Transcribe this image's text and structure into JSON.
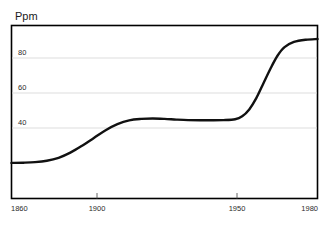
{
  "chart_data": {
    "type": "line",
    "title": "",
    "subtitle": "",
    "xlabel": "",
    "ylabel": "Ppm",
    "ylabel_position": "above-top-left",
    "grid": "horizontal-only",
    "legend": "none",
    "xlim": [
      1860,
      1990
    ],
    "ylim": [
      0,
      100
    ],
    "xticks": [
      1860,
      1900,
      1950,
      1980
    ],
    "xtick_labels": [
      "1860",
      "1900",
      "1950",
      "1980"
    ],
    "yticks": [
      40,
      60,
      80
    ],
    "ytick_labels": [
      "40",
      "60",
      "80"
    ],
    "series": [
      {
        "name": "Ppm",
        "color": "#111111",
        "x": [
          1860,
          1865,
          1870,
          1875,
          1880,
          1885,
          1890,
          1895,
          1900,
          1905,
          1910,
          1915,
          1920,
          1925,
          1930,
          1935,
          1940,
          1945,
          1950,
          1955,
          1958,
          1961,
          1964,
          1967,
          1970,
          1973,
          1976,
          1980,
          1985,
          1990
        ],
        "y": [
          20.6,
          20.7,
          21.0,
          21.8,
          23.5,
          26.5,
          30.5,
          35.0,
          39.5,
          43.0,
          45.2,
          46.0,
          46.2,
          46.0,
          45.6,
          45.3,
          45.2,
          45.2,
          45.3,
          45.8,
          47.5,
          51.5,
          58.0,
          66.5,
          75.0,
          82.5,
          87.5,
          90.5,
          91.8,
          92.2
        ]
      }
    ]
  },
  "axes": {
    "ylabel_text": "Ppm"
  },
  "icons": {
    "ytick_mark": "tick-mark",
    "xtick_mark": "tick-mark"
  },
  "colors": {
    "series_line": "#111111",
    "frame": "#000000",
    "gridline": "#d9d9d9",
    "tick_text": "#2b2b2b",
    "background": "#ffffff"
  }
}
